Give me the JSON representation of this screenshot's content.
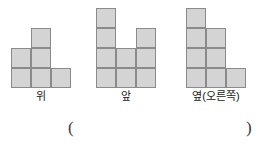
{
  "problem": {
    "cell_size": 20,
    "fill_color": "#d4d4d4",
    "border_color": "#8a8a8a",
    "views": [
      {
        "id": "top",
        "label": "위",
        "columns": 3,
        "rows": 3,
        "cells": [
          {
            "col": 1,
            "row": 0
          },
          {
            "col": 0,
            "row": 1
          },
          {
            "col": 1,
            "row": 1
          },
          {
            "col": 0,
            "row": 2
          },
          {
            "col": 1,
            "row": 2
          },
          {
            "col": 2,
            "row": 2
          }
        ]
      },
      {
        "id": "front",
        "label": "앞",
        "columns": 3,
        "rows": 4,
        "cells": [
          {
            "col": 0,
            "row": 0
          },
          {
            "col": 0,
            "row": 1
          },
          {
            "col": 2,
            "row": 1
          },
          {
            "col": 0,
            "row": 2
          },
          {
            "col": 1,
            "row": 2
          },
          {
            "col": 2,
            "row": 2
          },
          {
            "col": 0,
            "row": 3
          },
          {
            "col": 1,
            "row": 3
          },
          {
            "col": 2,
            "row": 3
          }
        ]
      },
      {
        "id": "side",
        "label": "옆(오른쪽)",
        "columns": 3,
        "rows": 4,
        "cells": [
          {
            "col": 0,
            "row": 0
          },
          {
            "col": 0,
            "row": 1
          },
          {
            "col": 1,
            "row": 1
          },
          {
            "col": 0,
            "row": 2
          },
          {
            "col": 1,
            "row": 2
          },
          {
            "col": 0,
            "row": 3
          },
          {
            "col": 1,
            "row": 3
          },
          {
            "col": 2,
            "row": 3
          }
        ]
      }
    ]
  },
  "answer": {
    "open_paren": "(",
    "close_paren": ")",
    "value": ""
  }
}
